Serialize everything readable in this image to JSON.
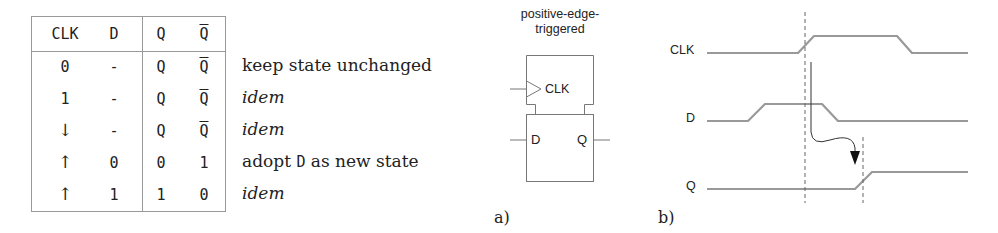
{
  "truth_table": {
    "headers": [
      "CLK",
      "D",
      "Q",
      "Q̄"
    ],
    "rows": [
      {
        "clk": "0",
        "d": "-",
        "q": "Q",
        "qbar": "Q",
        "qbar_overline": true,
        "description": "keep state unchanged",
        "desc_italic": false
      },
      {
        "clk": "1",
        "d": "-",
        "q": "Q",
        "qbar": "Q",
        "qbar_overline": true,
        "description": "idem",
        "desc_italic": true
      },
      {
        "clk": "↓",
        "d": "-",
        "q": "Q",
        "qbar": "Q",
        "qbar_overline": true,
        "description": "idem",
        "desc_italic": true
      },
      {
        "clk": "↑",
        "d": "0",
        "q": "0",
        "qbar": "1",
        "qbar_overline": false,
        "description_parts": [
          "adopt ",
          "D",
          " as new state"
        ],
        "desc_italic": false
      },
      {
        "clk": "↑",
        "d": "1",
        "q": "1",
        "qbar": "0",
        "qbar_overline": false,
        "description": "idem",
        "desc_italic": true
      }
    ]
  },
  "flipflop": {
    "title_line1": "positive-edge-",
    "title_line2": "triggered",
    "clk_pin": "CLK",
    "d_pin": "D",
    "q_pin": "Q",
    "panel_label": "a)"
  },
  "timing": {
    "signals": [
      "CLK",
      "D",
      "Q"
    ],
    "panel_label": "b)",
    "line_color": "#999999"
  }
}
